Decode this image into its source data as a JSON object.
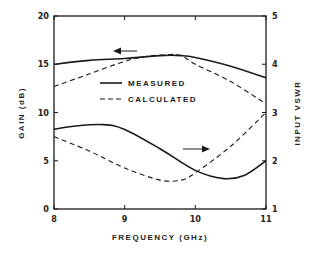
{
  "chart_data": {
    "type": "line",
    "title": "",
    "xlabel": "FREQUENCY (GHz)",
    "ylabel_left": "GAIN (dB)",
    "ylabel_right": "INPUT VSWR",
    "xlim": [
      8,
      11
    ],
    "ylim_left": [
      0,
      20
    ],
    "ylim_right": [
      1,
      5
    ],
    "x_ticks": [
      "8",
      "9",
      "10",
      "11"
    ],
    "y_ticks_left": [
      "0",
      "5",
      "10",
      "15",
      "20"
    ],
    "y_ticks_right": [
      "1",
      "2",
      "3",
      "4",
      "5"
    ],
    "grid": false,
    "legend": {
      "position": "inside-upper-center",
      "entries": [
        {
          "label": "MEASURED",
          "style": "solid"
        },
        {
          "label": "CALCULATED",
          "style": "dashed"
        }
      ]
    },
    "annotations": [
      {
        "type": "arrow",
        "direction": "left",
        "meaning": "gain curves refer to left axis"
      },
      {
        "type": "arrow",
        "direction": "right",
        "meaning": "VSWR curves refer to right axis"
      }
    ],
    "series": [
      {
        "name": "Gain (measured)",
        "axis": "left",
        "style": "solid",
        "x": [
          8.0,
          8.5,
          9.0,
          9.5,
          9.8,
          10.0,
          10.5,
          11.0
        ],
        "y": [
          15.0,
          15.4,
          15.6,
          15.9,
          15.9,
          15.7,
          14.8,
          13.6
        ]
      },
      {
        "name": "Gain (calculated)",
        "axis": "left",
        "style": "dashed",
        "x": [
          8.0,
          8.5,
          9.0,
          9.3,
          9.6,
          9.8,
          10.0,
          10.5,
          11.0
        ],
        "y": [
          12.7,
          14.0,
          15.3,
          15.8,
          16.0,
          15.9,
          15.0,
          13.2,
          10.9
        ]
      },
      {
        "name": "Input VSWR (measured)",
        "axis": "right",
        "style": "solid",
        "x": [
          8.0,
          8.3,
          8.7,
          9.0,
          9.5,
          10.0,
          10.4,
          10.7,
          11.0
        ],
        "y": [
          2.65,
          2.72,
          2.75,
          2.65,
          2.25,
          1.8,
          1.63,
          1.7,
          2.0
        ]
      },
      {
        "name": "Input VSWR (calculated)",
        "axis": "right",
        "style": "dashed",
        "x": [
          8.0,
          8.5,
          9.0,
          9.5,
          9.8,
          10.0,
          10.5,
          11.0
        ],
        "y": [
          2.5,
          2.2,
          1.85,
          1.6,
          1.6,
          1.75,
          2.3,
          3.0
        ]
      }
    ]
  },
  "labels": {
    "xlabel": "FREQUENCY (GHz)",
    "ylabel_left": "GAIN (dB)",
    "ylabel_right": "INPUT VSWR",
    "legend_measured": "MEASURED",
    "legend_calculated": "CALCULATED"
  },
  "colors": {
    "line": "#1a1a1a",
    "background": "#ffffff"
  }
}
